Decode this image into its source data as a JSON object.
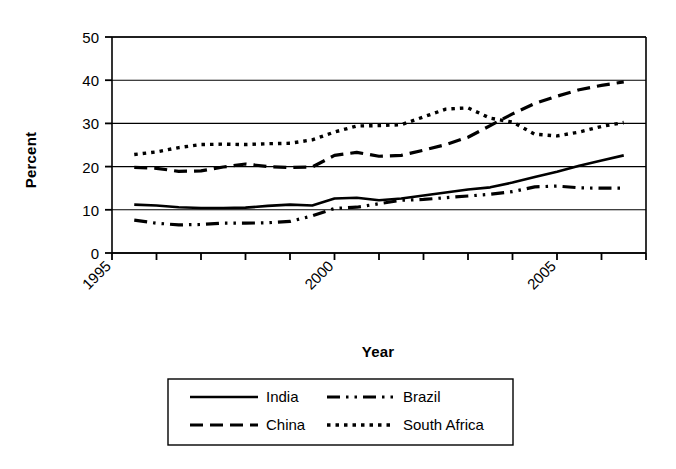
{
  "chart_data": {
    "type": "line",
    "title": "",
    "xlabel": "Year",
    "ylabel": "Percent",
    "xlim": [
      1995,
      2007
    ],
    "ylim": [
      0,
      50
    ],
    "yticks": [
      0,
      10,
      20,
      30,
      40,
      50
    ],
    "ytick_labels": [
      "0",
      "10",
      "20",
      "30",
      "40",
      "50"
    ],
    "xticks": [
      1995,
      1996,
      1997,
      1998,
      1999,
      2000,
      2001,
      2002,
      2003,
      2004,
      2005,
      2006,
      2007
    ],
    "xtick_labels": [
      "1995",
      "",
      "",
      "",
      "",
      "2000",
      "",
      "",
      "",
      "",
      "2005",
      "",
      ""
    ],
    "xtick_labels_visible": [
      "1995",
      "2000",
      "2005"
    ],
    "grid": "horizontal",
    "legend_position": "below",
    "x": [
      1995.5,
      1996,
      1996.5,
      1997,
      1997.5,
      1998,
      1998.5,
      1999,
      1999.5,
      2000,
      2000.5,
      2001,
      2001.5,
      2002,
      2002.5,
      2003,
      2003.5,
      2004,
      2004.5,
      2005,
      2005.5,
      2006,
      2006.5
    ],
    "series": [
      {
        "name": "India",
        "style": "solid",
        "values": [
          11.2,
          11.0,
          10.6,
          10.4,
          10.4,
          10.5,
          10.9,
          11.2,
          11.0,
          12.6,
          12.8,
          12.2,
          12.6,
          13.3,
          14.0,
          14.7,
          15.2,
          16.3,
          17.6,
          18.8,
          20.2,
          21.4,
          22.6
        ]
      },
      {
        "name": "China",
        "style": "dashed",
        "values": [
          19.8,
          19.6,
          18.9,
          19.0,
          19.9,
          20.6,
          20.0,
          19.8,
          19.9,
          22.6,
          23.3,
          22.4,
          22.6,
          23.8,
          25.1,
          26.8,
          29.5,
          32.2,
          34.6,
          36.3,
          37.8,
          38.8,
          39.6
        ]
      },
      {
        "name": "Brazil",
        "style": "dashdot",
        "values": [
          7.6,
          6.9,
          6.5,
          6.6,
          6.9,
          6.9,
          7.0,
          7.3,
          8.6,
          10.3,
          10.6,
          11.4,
          12.2,
          12.4,
          12.8,
          13.2,
          13.6,
          14.2,
          15.3,
          15.5,
          15.1,
          15.0,
          15.0
        ]
      },
      {
        "name": "South Africa",
        "style": "dotted",
        "values": [
          22.8,
          23.4,
          24.4,
          25.1,
          25.2,
          25.1,
          25.3,
          25.4,
          26.2,
          28.0,
          29.4,
          29.5,
          29.7,
          31.5,
          33.3,
          33.6,
          31.2,
          30.3,
          27.5,
          27.1,
          28.0,
          29.3,
          30.2
        ]
      }
    ]
  },
  "axis": {
    "ylabel": "Percent",
    "xlabel": "Year",
    "ytick_labels": [
      "50",
      "40",
      "30",
      "20",
      "10",
      "0"
    ],
    "xtick_labels": [
      "1995",
      "2000",
      "2005"
    ]
  },
  "legend": {
    "entries": [
      {
        "label": "India",
        "style": "solid"
      },
      {
        "label": "Brazil",
        "style": "dashdot"
      },
      {
        "label": "China",
        "style": "dashed"
      },
      {
        "label": "South Africa",
        "style": "dotted"
      }
    ]
  }
}
